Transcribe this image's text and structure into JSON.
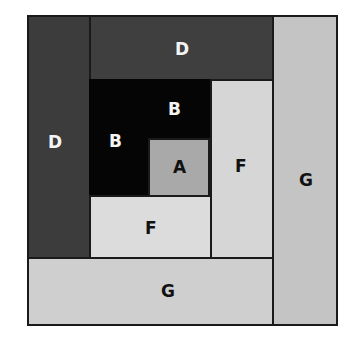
{
  "diagram": {
    "type": "log-cabin-quilt-block",
    "pieces": [
      {
        "id": "d-left",
        "label": "D",
        "fill": "#3c3c3c",
        "text_color": "#f4f4f4",
        "rect": [
          0,
          0,
          64,
          244
        ],
        "label_pos": [
          29,
          128
        ]
      },
      {
        "id": "d-top",
        "label": "D",
        "fill": "#3f3f3f",
        "text_color": "#f4f4f4",
        "rect": [
          62,
          0,
          185,
          66
        ],
        "label_pos": [
          153,
          35
        ]
      },
      {
        "id": "b",
        "label": "B",
        "fill": "#050505",
        "text_color": "#f4f4f4",
        "rect": [
          62,
          64,
          123,
          118
        ],
        "label_pos": [
          88,
          127
        ]
      },
      {
        "id": "b-top",
        "label": "B",
        "fill": "transparent",
        "text_color": "#f4f4f4",
        "rect": [
          0,
          0,
          0,
          0
        ],
        "label_pos": [
          148,
          95
        ]
      },
      {
        "id": "a",
        "label": "A",
        "fill": "#a9a9a9",
        "text_color": "#111111",
        "rect": [
          121,
          123,
          62,
          59
        ],
        "label_pos": [
          152,
          153
        ]
      },
      {
        "id": "f-bottom",
        "label": "F",
        "fill": "#dcdcdc",
        "text_color": "#111111",
        "rect": [
          62,
          180,
          123,
          64
        ],
        "label_pos": [
          123,
          214
        ]
      },
      {
        "id": "f-right",
        "label": "F",
        "fill": "#d6d6d6",
        "text_color": "#111111",
        "rect": [
          183,
          64,
          64,
          180
        ],
        "label_pos": [
          214,
          152
        ]
      },
      {
        "id": "g-bottom",
        "label": "G",
        "fill": "#cfcfcf",
        "text_color": "#111111",
        "rect": [
          0,
          242,
          247,
          69
        ],
        "label_pos": [
          141,
          276
        ]
      },
      {
        "id": "g-right",
        "label": "G",
        "fill": "#c4c4c4",
        "text_color": "#111111",
        "rect": [
          245,
          0,
          66,
          311
        ],
        "label_pos": [
          279,
          166
        ]
      }
    ]
  },
  "labels": {
    "d_left": "D",
    "d_top": "D",
    "b_left": "B",
    "b_top": "B",
    "a": "A",
    "f_bottom": "F",
    "f_right": "F",
    "g_bottom": "G",
    "g_right": "G"
  },
  "colors": {
    "outline": "#1a1a1a",
    "dark_fabric_d": "#3c3c3c",
    "black_fabric_b": "#050505",
    "medium_fabric_a": "#a9a9a9",
    "light_fabric_f": "#dcdcdc",
    "light_fabric_g": "#c8c8c8"
  }
}
